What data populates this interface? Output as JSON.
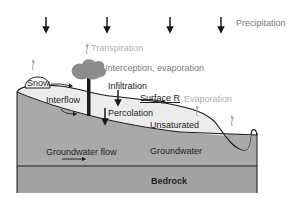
{
  "diagram": {
    "labels": {
      "precipitation": "Precipitation",
      "transpiration": "Transpiration",
      "interception": "Interception, evaporation",
      "snow": "Snow",
      "infiltration": "Infiltration",
      "surface_runoff": "Surface R",
      "evaporation": "Evaporation",
      "interflow": "Interflow",
      "percolation": "Percolation",
      "unsaturated": "Unsaturated",
      "groundwater_flow": "Groundwater flow",
      "groundwater": "Groundwater",
      "bedrock": "Bedrock"
    },
    "colors": {
      "unsaturated_zone": "#ececec",
      "groundwater_zone": "#a9a9a9",
      "bedrock_zone": "#a2a2a2",
      "tree_canopy": "#8c8c8c",
      "outline": "#1a1a1a",
      "faint_arrow": "#a8a8a8"
    },
    "icons": {
      "precipitation_arrows": [
        "arrow-down-icon",
        "arrow-down-icon",
        "arrow-down-icon",
        "arrow-down-icon"
      ],
      "tree": "tree-icon",
      "snow": "snow-mound-icon"
    }
  }
}
